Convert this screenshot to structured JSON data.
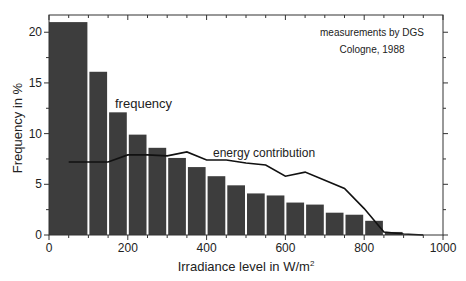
{
  "chart_data": {
    "type": "bar",
    "title": "",
    "xlabel": "Irradiance level in W/m²",
    "xlabel_base": "Irradiance level in W/m",
    "xlabel_sup": "2",
    "ylabel": "Frequency in %",
    "xlim": [
      0,
      1000
    ],
    "ylim": [
      0,
      21.7
    ],
    "xticks": [
      0,
      200,
      400,
      600,
      800,
      1000
    ],
    "yticks": [
      0,
      5,
      10,
      15,
      20
    ],
    "grid": false,
    "legend": "none (inline annotations)",
    "annotations": [
      {
        "text": "measurements by DGS",
        "position": "top-right"
      },
      {
        "text": "Cologne, 1988",
        "position": "top-right"
      },
      {
        "text": "frequency",
        "x": 280,
        "y": 12.9
      },
      {
        "text": "energy contribution",
        "x": 600,
        "y": 8.0
      }
    ],
    "bins": [
      {
        "from": 0,
        "to": 100,
        "value": 21.0
      },
      {
        "from": 100,
        "to": 150,
        "value": 16.1
      },
      {
        "from": 150,
        "to": 200,
        "value": 12.1
      },
      {
        "from": 200,
        "to": 250,
        "value": 9.9
      },
      {
        "from": 250,
        "to": 300,
        "value": 8.6
      },
      {
        "from": 300,
        "to": 350,
        "value": 7.6
      },
      {
        "from": 350,
        "to": 400,
        "value": 6.7
      },
      {
        "from": 400,
        "to": 450,
        "value": 5.8
      },
      {
        "from": 450,
        "to": 500,
        "value": 4.9
      },
      {
        "from": 500,
        "to": 550,
        "value": 4.1
      },
      {
        "from": 550,
        "to": 600,
        "value": 3.9
      },
      {
        "from": 600,
        "to": 650,
        "value": 3.2
      },
      {
        "from": 650,
        "to": 700,
        "value": 3.0
      },
      {
        "from": 700,
        "to": 750,
        "value": 2.2
      },
      {
        "from": 750,
        "to": 800,
        "value": 2.0
      },
      {
        "from": 800,
        "to": 850,
        "value": 1.4
      },
      {
        "from": 850,
        "to": 900,
        "value": 0.3
      }
    ],
    "series": [
      {
        "name": "frequency",
        "type": "bar",
        "values": [
          21.0,
          16.1,
          12.1,
          9.9,
          8.6,
          7.6,
          6.7,
          5.8,
          4.9,
          4.1,
          3.9,
          3.2,
          3.0,
          2.2,
          2.0,
          1.4,
          0.3
        ]
      },
      {
        "name": "energy contribution",
        "type": "line",
        "x": [
          50,
          150,
          200,
          250,
          300,
          350,
          400,
          450,
          500,
          550,
          600,
          650,
          700,
          750,
          800,
          850,
          900,
          950
        ],
        "values": [
          7.2,
          7.2,
          7.9,
          7.9,
          7.8,
          8.2,
          7.4,
          7.4,
          7.1,
          6.9,
          5.8,
          6.2,
          5.4,
          4.6,
          2.6,
          0.3,
          0.1,
          0.0
        ]
      }
    ],
    "colors": {
      "bar_fill": "#3d3d3d",
      "bar_gap": "#ffffff",
      "line": "#111111",
      "axis": "#333333"
    }
  }
}
